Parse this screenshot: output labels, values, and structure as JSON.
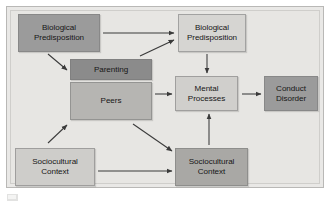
{
  "diagram": {
    "background_color": "#e7e6e3",
    "border_color": "#b9b8b6",
    "nodes": [
      {
        "id": "bio-pred-left",
        "label": "Biological\nPredisposition",
        "color": "#9b9b9b",
        "x": 18,
        "y": 14,
        "w": 82,
        "h": 38
      },
      {
        "id": "bio-pred-right",
        "label": "Biological\nPredisposition",
        "color": "#d6d5d2",
        "x": 178,
        "y": 14,
        "w": 68,
        "h": 38
      },
      {
        "id": "parenting",
        "label": "Parenting",
        "color": "#8b8b8b",
        "x": 70,
        "y": 59,
        "w": 82,
        "h": 21
      },
      {
        "id": "peers",
        "label": "Peers",
        "color": "#b6b5b2",
        "x": 70,
        "y": 82,
        "w": 82,
        "h": 38
      },
      {
        "id": "mental-processes",
        "label": "Mental\nProcesses",
        "color": "#d0cfcc",
        "x": 175,
        "y": 76,
        "w": 63,
        "h": 35
      },
      {
        "id": "conduct-disorder",
        "label": "Conduct\nDisorder",
        "color": "#9b9b9b",
        "x": 264,
        "y": 76,
        "w": 54,
        "h": 35
      },
      {
        "id": "socio-left",
        "label": "Sociocultural\nContext",
        "color": "#cecdca",
        "x": 15,
        "y": 148,
        "w": 80,
        "h": 38
      },
      {
        "id": "socio-right",
        "label": "Sociocultural\nContext",
        "color": "#a9a8a5",
        "x": 175,
        "y": 148,
        "w": 73,
        "h": 38
      }
    ],
    "arrows": [
      {
        "id": "bioleft-to-bioright",
        "from": "bio-pred-left",
        "to": "bio-pred-right",
        "kind": "horizontal-right"
      },
      {
        "id": "bioleft-to-parenting",
        "from": "bio-pred-left",
        "to": "parenting",
        "kind": "diagonal-down-right"
      },
      {
        "id": "parenting-to-bioright",
        "from": "parenting",
        "to": "bio-pred-right",
        "kind": "diagonal-up-right"
      },
      {
        "id": "bioright-to-mental",
        "from": "bio-pred-right",
        "to": "mental-processes",
        "kind": "vertical-down"
      },
      {
        "id": "peers-to-mental",
        "from": "peers",
        "to": "mental-processes",
        "kind": "horizontal-right"
      },
      {
        "id": "mental-to-conduct",
        "from": "mental-processes",
        "to": "conduct-disorder",
        "kind": "horizontal-right"
      },
      {
        "id": "socioleft-to-peers",
        "from": "socio-left",
        "to": "peers",
        "kind": "diagonal-up-right"
      },
      {
        "id": "peers-to-socioright",
        "from": "peers",
        "to": "socio-right",
        "kind": "diagonal-down-right"
      },
      {
        "id": "socioleft-to-socioright",
        "from": "socio-left",
        "to": "socio-right",
        "kind": "horizontal-right"
      },
      {
        "id": "socioright-to-mental",
        "from": "socio-right",
        "to": "mental-processes",
        "kind": "vertical-up"
      }
    ],
    "arrow_color": "#3a3a3a"
  },
  "chart_data": {
    "type": "diagram",
    "nodes": [
      "Biological Predisposition",
      "Biological Predisposition",
      "Parenting",
      "Peers",
      "Mental Processes",
      "Conduct Disorder",
      "Sociocultural Context",
      "Sociocultural Context"
    ],
    "edges": [
      [
        "Biological Predisposition (left)",
        "Biological Predisposition (right)"
      ],
      [
        "Biological Predisposition (left)",
        "Parenting"
      ],
      [
        "Parenting",
        "Biological Predisposition (right)"
      ],
      [
        "Biological Predisposition (right)",
        "Mental Processes"
      ],
      [
        "Peers",
        "Mental Processes"
      ],
      [
        "Mental Processes",
        "Conduct Disorder"
      ],
      [
        "Sociocultural Context (left)",
        "Peers"
      ],
      [
        "Peers",
        "Sociocultural Context (right)"
      ],
      [
        "Sociocultural Context (left)",
        "Sociocultural Context (right)"
      ],
      [
        "Sociocultural Context (right)",
        "Mental Processes"
      ]
    ]
  }
}
